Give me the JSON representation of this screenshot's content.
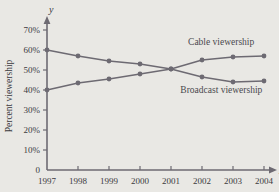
{
  "chart_data": {
    "type": "line",
    "title": "",
    "xlabel": "x",
    "ylabel": "Percent viewership",
    "y_axis_name": "y",
    "x_axis_name": "x",
    "categories": [
      "1997",
      "1998",
      "1999",
      "2000",
      "2001",
      "2002",
      "2003",
      "2004"
    ],
    "x": [
      1997,
      1998,
      1999,
      2000,
      2001,
      2002,
      2003,
      2004
    ],
    "xlim": [
      1997,
      2004
    ],
    "ylim": [
      0,
      75
    ],
    "grid": false,
    "legend_position": "inline-annotation",
    "ytick_labels": [
      "70%",
      "60%",
      "50%",
      "40%",
      "30%",
      "20%",
      "10%",
      "0"
    ],
    "ytick_values": [
      70,
      60,
      50,
      40,
      30,
      20,
      10,
      0
    ],
    "xtick_labels": [
      "1997",
      "1998",
      "1999",
      "2000",
      "2001",
      "2002",
      "2003",
      "2004"
    ],
    "series": [
      {
        "name": "Cable viewership",
        "values": [
          40,
          43.5,
          45.5,
          48,
          50.5,
          55,
          56.5,
          57
        ],
        "color": "#6d6a72"
      },
      {
        "name": "Broadcast viewership",
        "values": [
          60,
          57,
          54.5,
          53,
          50.5,
          46.5,
          44,
          44.5
        ],
        "color": "#6d6a72"
      }
    ],
    "annotations": [
      {
        "text": "Cable viewership",
        "x": 2001.55,
        "y": 62.5
      },
      {
        "text": "Broadcast viewership",
        "x": 2001.3,
        "y": 38.5
      }
    ],
    "colors": {
      "background": "#e9e8e4",
      "axis": "#6d6a72",
      "line": "#6d6a72",
      "marker": "#6d6a72",
      "text": "#3b3a3e"
    }
  }
}
